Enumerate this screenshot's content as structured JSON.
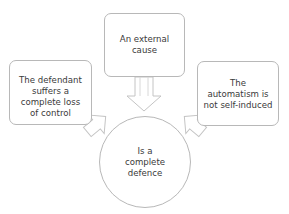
{
  "diagram": {
    "type": "convergent-flow",
    "nodes": [
      {
        "id": "top",
        "shape": "rounded-rectangle",
        "label": "An external\ncause"
      },
      {
        "id": "left",
        "shape": "rounded-rectangle",
        "label": "The defendant\nsuffers a\ncomplete loss\nof control"
      },
      {
        "id": "right",
        "shape": "rounded-rectangle",
        "label": "The\nautomatism is\nnot self-induced"
      },
      {
        "id": "center",
        "shape": "circle",
        "label": "Is a\ncomplete\ndefence"
      }
    ],
    "edges": [
      {
        "from": "top",
        "to": "center",
        "style": "block-arrow",
        "direction": "down"
      },
      {
        "from": "left",
        "to": "center",
        "style": "block-arrow",
        "direction": "down-right"
      },
      {
        "from": "right",
        "to": "center",
        "style": "block-arrow",
        "direction": "down-left"
      }
    ],
    "colors": {
      "border": "#b8b8b8",
      "arrow_stroke": "#c4c4c4",
      "fill": "#ffffff",
      "text": "#3a3a3a"
    }
  }
}
